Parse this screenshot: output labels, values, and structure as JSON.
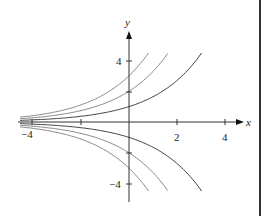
{
  "chart_data": {
    "type": "line",
    "title": "",
    "xlabel": "x",
    "ylabel": "y",
    "xlim": [
      -4.5,
      4.5
    ],
    "ylim": [
      -5,
      5
    ],
    "x_ticks": [
      -4,
      -2,
      2,
      4
    ],
    "x_tick_labels": [
      "-4",
      "",
      "2",
      "4"
    ],
    "y_ticks": [
      4,
      2,
      -2,
      -4
    ],
    "y_tick_labels": [
      "4",
      "",
      "",
      "-4"
    ],
    "grid": false,
    "legend": null,
    "series": [
      {
        "name": "C=1",
        "C": 1,
        "x_range": [
          -4.5,
          3.0
        ]
      },
      {
        "name": "C=2",
        "C": 2,
        "x_range": [
          -4.5,
          1.6
        ]
      },
      {
        "name": "C=3",
        "C": 3,
        "x_range": [
          -4.5,
          0.8
        ]
      },
      {
        "name": "C=-1",
        "C": -1,
        "x_range": [
          -4.5,
          3.0
        ]
      },
      {
        "name": "C=-2",
        "C": -2,
        "x_range": [
          -4.5,
          1.6
        ]
      },
      {
        "name": "C=-3",
        "C": -3,
        "x_range": [
          -4.5,
          0.8
        ]
      }
    ],
    "colors": {
      "axis": "#333333",
      "curve_dark": "#444444",
      "curve_light": "#888888"
    }
  },
  "labels": {
    "x_axis": "x",
    "y_axis": "y",
    "tick_x_neg4": "−4",
    "tick_x_2": "2",
    "tick_x_4": "4",
    "tick_y_4": "4",
    "tick_y_neg4": "−4"
  }
}
